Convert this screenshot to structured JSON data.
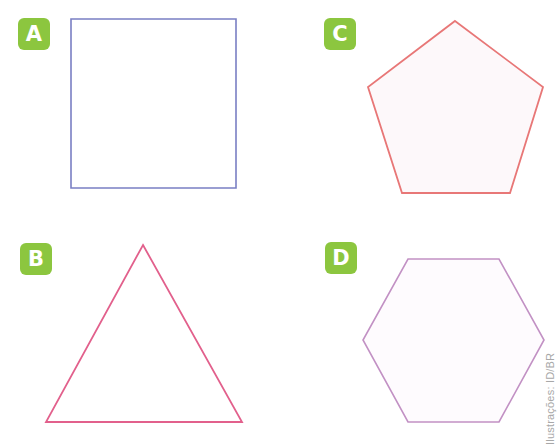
{
  "figures": [
    {
      "label": "A",
      "shape": "square",
      "stroke": "#7a7fc4",
      "fill": "#ffffff",
      "badge_pos": [
        18,
        18
      ],
      "points": "71,19 236,19 236,188 71,188"
    },
    {
      "label": "B",
      "shape": "triangle",
      "stroke": "#e2608c",
      "fill": "#ffffff",
      "badge_pos": [
        20,
        243
      ],
      "points": "143,245 242,422 46,422"
    },
    {
      "label": "C",
      "shape": "pentagon",
      "stroke": "#e87777",
      "fill": "#fdf8fa",
      "badge_pos": [
        324,
        18
      ],
      "points": "455,21 543,87 510,193 402,193 368,87"
    },
    {
      "label": "D",
      "shape": "hexagon",
      "stroke": "#c291c4",
      "fill": "#fefbfe",
      "badge_pos": [
        325,
        242
      ],
      "points": "408,259 499,259 544,340 499,422 408,422 363,340"
    }
  ],
  "badge_color": "#8cc63f",
  "credit": "Ilustrações: ID/BR"
}
